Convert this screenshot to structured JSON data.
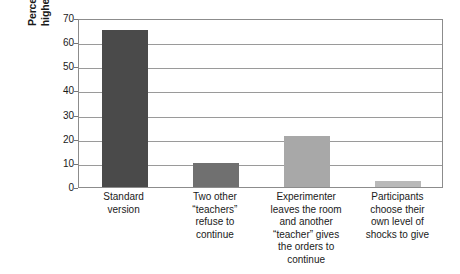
{
  "chart_data": {
    "type": "bar",
    "title": "",
    "xlabel": "",
    "ylabel_line1": "Percentage giving the",
    "ylabel_line2": "highest level of shock",
    "ylim": [
      0,
      70
    ],
    "ytick_labels": [
      "0",
      "10",
      "20",
      "30",
      "40",
      "50",
      "60",
      "70"
    ],
    "ytick_values": [
      0,
      10,
      20,
      30,
      40,
      50,
      60,
      70
    ],
    "grid": true,
    "legend": "none",
    "categories": [
      "Standard version",
      "Two other “teachers” refuse to continue",
      "Experimenter leaves the room and another “teacher” gives the orders to continue",
      "Participants choose their own level of shocks to give"
    ],
    "category_lines": [
      [
        "Standard",
        "version"
      ],
      [
        "Two other",
        "“teachers”",
        "refuse to",
        "continue"
      ],
      [
        "Experimenter",
        "leaves the room",
        "and another",
        "“teacher” gives",
        "the orders to",
        "continue"
      ],
      [
        "Participants",
        "choose their",
        "own level of",
        "shocks to give"
      ]
    ],
    "values": [
      65,
      10,
      21,
      2.5
    ],
    "bar_colors": [
      "#4a4a4a",
      "#707070",
      "#a8a8a8",
      "#b9b9b9"
    ],
    "axis_color": "#8c8c8c",
    "grid_color": "#9a9a9a",
    "background_color": "#ffffff"
  }
}
